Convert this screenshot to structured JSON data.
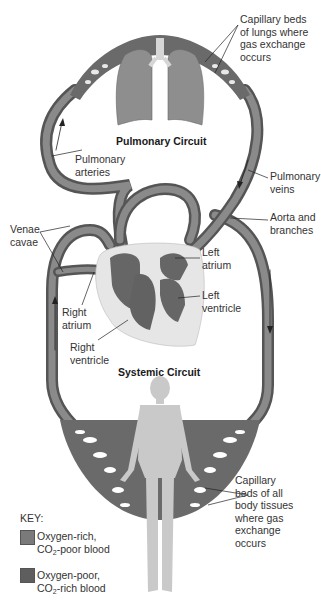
{
  "diagram": {
    "titles": {
      "pulmonary": "Pulmonary Circuit",
      "systemic": "Systemic Circuit"
    },
    "labels": {
      "capillary_lungs": [
        "Capillary beds",
        "of lungs where",
        "gas exchange",
        "occurs"
      ],
      "pulmonary_arteries": [
        "Pulmonary",
        "arteries"
      ],
      "pulmonary_veins": [
        "Pulmonary",
        "veins"
      ],
      "aorta": [
        "Aorta and",
        "branches"
      ],
      "venae_cavae": [
        "Venae",
        "cavae"
      ],
      "left_atrium": [
        "Left",
        "atrium"
      ],
      "left_ventricle": [
        "Left",
        "ventricle"
      ],
      "right_atrium": [
        "Right",
        "atrium"
      ],
      "right_ventricle": [
        "Right",
        "ventricle"
      ],
      "capillary_body": [
        "Capillary",
        "beds of all",
        "body tissues",
        "where gas",
        "exchange",
        "occurs"
      ]
    },
    "key": {
      "title": "KEY:",
      "items": [
        {
          "line1": "Oxygen-rich,",
          "line2_pre": "CO",
          "line2_sub": "2",
          "line2_post": "-poor blood",
          "color": "#7a7a7a"
        },
        {
          "line1": "Oxygen-poor,",
          "line2_pre": "CO",
          "line2_sub": "2",
          "line2_post": "-rich blood",
          "color": "#5e5e5e"
        }
      ]
    },
    "colors": {
      "vessel": "#6f6f6f",
      "vessel_highlight": "#9a9a9a",
      "heart_bg": "#e4e4e4",
      "heart_chamber": "#666666",
      "lungs": "#8e8e8e",
      "body": "#c8c8c8"
    }
  }
}
